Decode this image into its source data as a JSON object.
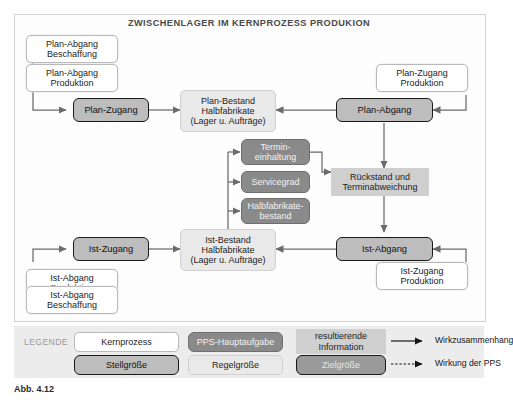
{
  "title": "ZWISCHENLAGER IM KERNPROZESS PRODUKION",
  "nodes": {
    "plan_abgang_beschaffung": "Plan-Abgang\nBeschaffung",
    "plan_abgang_produktion": "Plan-Abgang\nProduktion",
    "plan_zugang": "Plan-Zugang",
    "plan_bestand": "Plan-Bestand\nHalbfabrikate\n(Lager u. Aufträge)",
    "plan_abgang": "Plan-Abgang",
    "plan_zugang_produktion": "Plan-Zugang\nProduktion",
    "termineinhaltung": "Termin-\neinhaltung",
    "servicegrad": "Servicegrad",
    "halbfabrikatebestand": "Halbfabrikate-\nbestand",
    "rueckstand": "Rückstand und\nTerminabweichung",
    "ist_zugang": "Ist-Zugang",
    "ist_bestand": "Ist-Bestand\nHalbfabrikate\n(Lager u. Aufträge)",
    "ist_abgang": "Ist-Abgang",
    "ist_abgang_produktion": "Ist-Abgang\nProduktion",
    "ist_abgang_beschaffung": "Ist-Abgang\nBeschaffung",
    "ist_zugang_produktion": "Ist-Zugang\nProduktion"
  },
  "legend": {
    "label": "LEGENDE",
    "kernprozess": "Kernprozess",
    "pps_hauptaufgabe": "PPS-Hauptaufgabe",
    "resultierende_information": "resultierende\nInformation",
    "stellgroesse": "Stellgröße",
    "regelgroesse": "Regelgröße",
    "zielgroesse": "Zielgröße",
    "wirkzusammenhang": "Wirkzusammenhang",
    "wirkung_der_pps": "Wirkung der PPS"
  },
  "caption": "Abb. 4.12",
  "colors": {
    "core_fill": "#ffffff",
    "stell_fill": "#bdbdbd",
    "regel_fill": "#e9e9e9",
    "pps_fill": "#8a8a8a",
    "info_fill": "#cfcfcf",
    "ziel_fill": "#9a9a9a",
    "legend_band": "#ececec",
    "wire": "#6b6b6b"
  }
}
